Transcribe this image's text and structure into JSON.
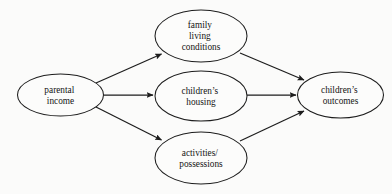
{
  "diagram": {
    "type": "path-diagram",
    "background_color": "#fbfbfa",
    "stroke_color": "#1d1d1d",
    "node_fill_color": "#fcfcfb",
    "nodes": [
      {
        "id": "parental-income",
        "role": "source",
        "lines": [
          "parental",
          "income"
        ],
        "cx": 60.5,
        "cy": 95,
        "rx": 43,
        "ry": 21
      },
      {
        "id": "family-living-conditions",
        "role": "mediator",
        "lines": [
          "family",
          "living",
          "conditions"
        ],
        "cx": 201,
        "cy": 36,
        "rx": 46,
        "ry": 26
      },
      {
        "id": "childrens-housing",
        "role": "mediator",
        "lines": [
          "children’s",
          "housing"
        ],
        "cx": 201,
        "cy": 96,
        "rx": 46,
        "ry": 25
      },
      {
        "id": "activities-possessions",
        "role": "mediator",
        "lines": [
          "activities/",
          "possessions"
        ],
        "cx": 201,
        "cy": 158,
        "rx": 46,
        "ry": 26
      },
      {
        "id": "childrens-outcomes",
        "role": "outcome",
        "lines": [
          "children’s",
          "outcomes"
        ],
        "cx": 340.5,
        "cy": 95,
        "rx": 43,
        "ry": 23
      }
    ],
    "edges": [
      {
        "id": "income-to-family-living-conditions",
        "from": "parental-income",
        "to": "family-living-conditions",
        "direction": "forward"
      },
      {
        "id": "income-to-childrens-housing",
        "from": "parental-income",
        "to": "childrens-housing",
        "direction": "forward"
      },
      {
        "id": "income-to-activities-possessions",
        "from": "parental-income",
        "to": "activities-possessions",
        "direction": "forward"
      },
      {
        "id": "family-living-conditions-to-outcomes",
        "from": "family-living-conditions",
        "to": "childrens-outcomes",
        "direction": "forward"
      },
      {
        "id": "childrens-housing-to-outcomes",
        "from": "childrens-housing",
        "to": "childrens-outcomes",
        "direction": "forward"
      },
      {
        "id": "activities-possessions-to-outcomes",
        "from": "activities-possessions",
        "to": "childrens-outcomes",
        "direction": "forward"
      }
    ]
  }
}
